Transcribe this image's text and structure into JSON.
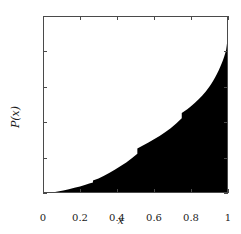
{
  "chart_data": {
    "type": "area",
    "title": "",
    "xlabel": "x",
    "ylabel": "P(x)",
    "xlim": [
      0,
      1
    ],
    "ylim": [
      0,
      1
    ],
    "grid": false,
    "legend": null,
    "fill_color": "#000000",
    "frame_color": "#4a4a4a",
    "xticks": [
      0,
      0.2,
      0.4,
      0.6,
      0.8,
      1
    ],
    "xtick_labels": [
      "0",
      "0.2",
      "0.4",
      "0.6",
      "0.8",
      "1"
    ],
    "yticks": [
      0,
      0.2,
      0.4,
      0.6,
      0.8,
      1
    ],
    "ytick_labels": [
      "0",
      "0.2",
      "0.4",
      "0.6",
      "0.8",
      "1"
    ],
    "series": [
      {
        "name": "P(x)",
        "style": "filled staircase (empirical CDF)",
        "x": [
          0.0,
          0.05,
          0.08,
          0.11,
          0.14,
          0.17,
          0.2,
          0.23,
          0.25,
          0.27,
          0.27,
          0.3,
          0.33,
          0.36,
          0.39,
          0.42,
          0.45,
          0.48,
          0.5,
          0.51,
          0.51,
          0.54,
          0.57,
          0.6,
          0.63,
          0.66,
          0.69,
          0.72,
          0.74,
          0.75,
          0.75,
          0.78,
          0.8,
          0.82,
          0.84,
          0.86,
          0.88,
          0.9,
          0.91,
          0.92,
          0.93,
          0.94,
          0.95,
          0.96,
          0.965,
          0.97,
          0.975,
          0.98,
          0.985,
          0.99,
          0.993,
          0.996,
          1.0
        ],
        "y": [
          0.0,
          0.003,
          0.008,
          0.014,
          0.021,
          0.029,
          0.037,
          0.046,
          0.053,
          0.06,
          0.07,
          0.082,
          0.098,
          0.115,
          0.133,
          0.152,
          0.173,
          0.196,
          0.213,
          0.222,
          0.252,
          0.268,
          0.285,
          0.303,
          0.322,
          0.343,
          0.366,
          0.392,
          0.412,
          0.422,
          0.452,
          0.473,
          0.49,
          0.508,
          0.528,
          0.55,
          0.574,
          0.601,
          0.617,
          0.634,
          0.652,
          0.672,
          0.694,
          0.717,
          0.73,
          0.743,
          0.757,
          0.772,
          0.79,
          0.81,
          0.832,
          0.857,
          0.885
        ]
      }
    ],
    "annotations": []
  }
}
